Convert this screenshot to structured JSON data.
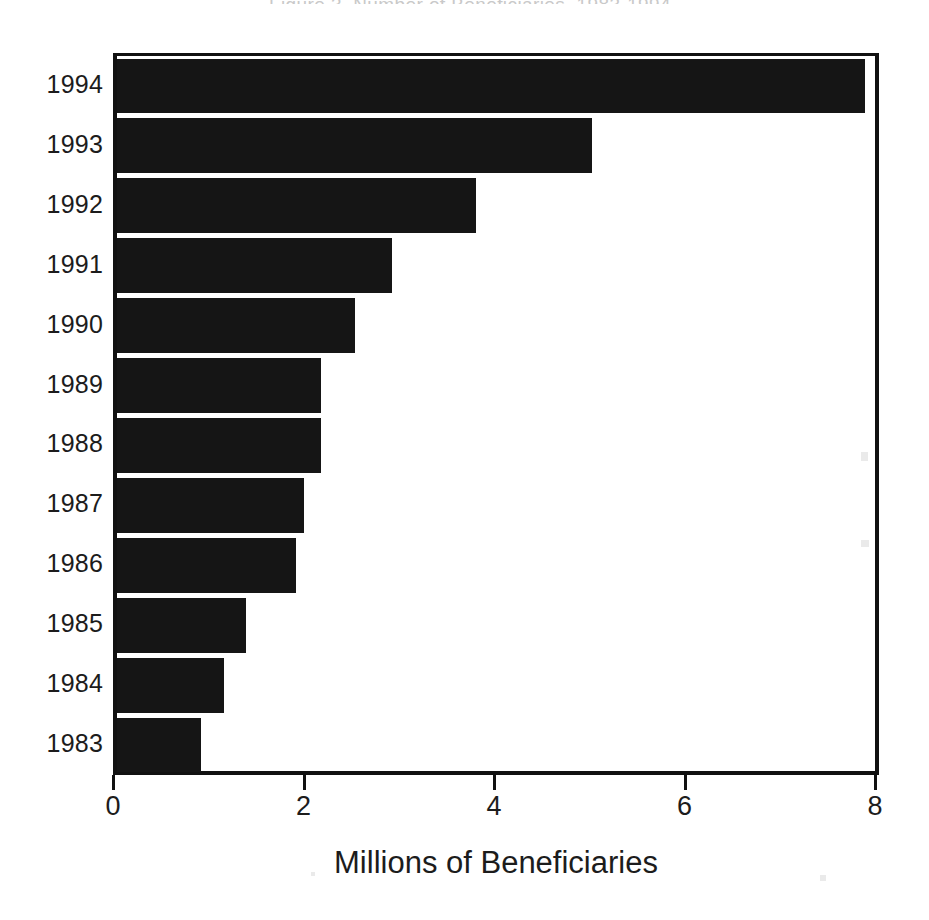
{
  "figure": {
    "title_remnant": "Figure 3. Number of Beneficiaries, 1983-1994",
    "background_color": "#ffffff",
    "bar_color": "#151515",
    "axis_color": "#111111"
  },
  "chart_data": {
    "type": "bar",
    "orientation": "horizontal",
    "title": "",
    "xlabel": "Millions of Beneficiaries",
    "ylabel": "",
    "categories": [
      "1994",
      "1993",
      "1992",
      "1991",
      "1990",
      "1989",
      "1988",
      "1987",
      "1986",
      "1985",
      "1984",
      "1983"
    ],
    "values": [
      7.85,
      4.99,
      3.77,
      2.89,
      2.5,
      2.14,
      2.14,
      1.96,
      1.88,
      1.35,
      1.12,
      0.88
    ],
    "xlim": [
      0,
      8
    ],
    "xticks": [
      0,
      2,
      4,
      6,
      8
    ],
    "xtick_labels": [
      "0",
      "2",
      "4",
      "6",
      "8"
    ],
    "grid": false,
    "legend": false,
    "series": [
      {
        "name": "Beneficiaries",
        "values": [
          7.85,
          4.99,
          3.77,
          2.89,
          2.5,
          2.14,
          2.14,
          1.96,
          1.88,
          1.35,
          1.12,
          0.88
        ]
      }
    ]
  }
}
